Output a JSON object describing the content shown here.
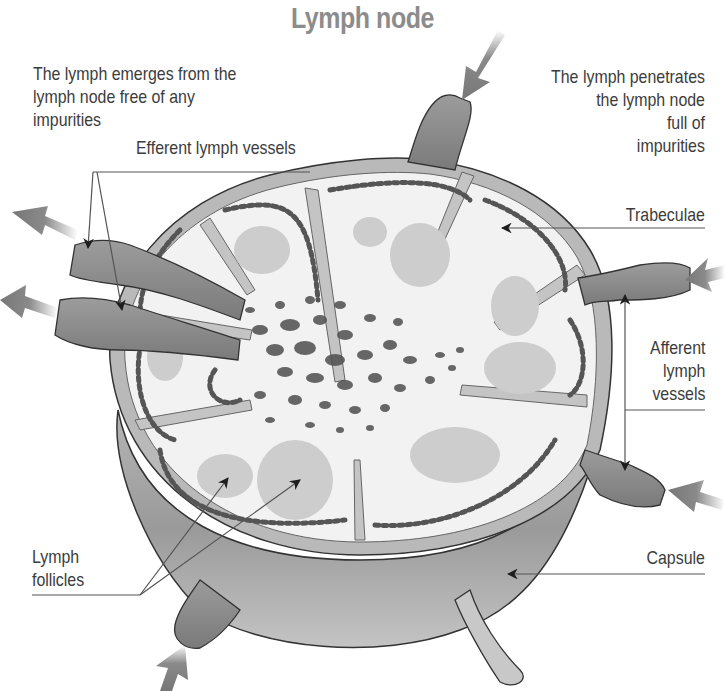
{
  "title": "Lymph node",
  "labels": {
    "lymph_emerges": "The lymph emerges from the\nlymph node free of any\nimpurities",
    "efferent_vessels": "Efferent lymph vessels",
    "lymph_penetrates": "The lymph penetrates\nthe lymph node\nfull of\nimpurities",
    "trabeculae": "Trabeculae",
    "afferent_vessels": "Afferent\nlymph\nvessels",
    "lymph_follicles": "Lymph\nfollicles",
    "capsule": "Capsule"
  },
  "flow_arrows": {
    "inbound_count": 4,
    "outbound_count": 2,
    "inbound_meaning": "afferent (impure lymph in)",
    "outbound_meaning": "efferent (clean lymph out)"
  },
  "colors": {
    "title": "#8c8c8c",
    "text": "#3c3c3c",
    "capsule_dark": "#7a7a7a",
    "capsule_mid": "#a8a8a8",
    "capsule_light": "#c9c9c9",
    "cortex": "#f1f1f1",
    "follicle": "#cfcfcf",
    "cell": "#5a5a5a",
    "leader_line": "#555555"
  }
}
